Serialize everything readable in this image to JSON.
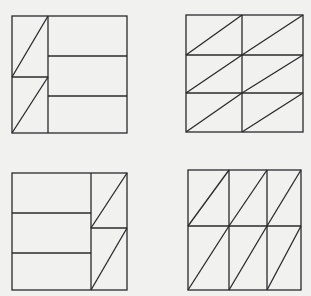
{
  "figures": [
    {
      "id": "figure-top-left",
      "frame": {
        "x": 12,
        "y": 16,
        "w": 115,
        "h": 117
      },
      "lines": [
        [
          48,
          16,
          48,
          133
        ],
        [
          12,
          77,
          48,
          77
        ],
        [
          48,
          56,
          127,
          56
        ],
        [
          48,
          96,
          127,
          96
        ],
        [
          12,
          77,
          48,
          16
        ],
        [
          12,
          133,
          48,
          77
        ]
      ]
    },
    {
      "id": "figure-top-right",
      "frame": {
        "x": 186,
        "y": 15,
        "w": 117,
        "h": 117
      },
      "lines": [
        [
          242,
          15,
          242,
          132
        ],
        [
          186,
          55,
          303,
          55
        ],
        [
          186,
          93,
          303,
          93
        ],
        [
          186,
          55,
          242,
          15
        ],
        [
          242,
          55,
          303,
          15
        ],
        [
          186,
          93,
          242,
          55
        ],
        [
          242,
          93,
          303,
          55
        ],
        [
          186,
          132,
          242,
          93
        ],
        [
          242,
          132,
          303,
          93
        ]
      ]
    },
    {
      "id": "figure-bottom-left",
      "frame": {
        "x": 12,
        "y": 173,
        "w": 115,
        "h": 117
      },
      "lines": [
        [
          91,
          173,
          91,
          290
        ],
        [
          12,
          213,
          91,
          213
        ],
        [
          12,
          253,
          91,
          253
        ],
        [
          91,
          228,
          127,
          228
        ],
        [
          91,
          228,
          127,
          173
        ],
        [
          91,
          290,
          127,
          228
        ]
      ]
    },
    {
      "id": "figure-bottom-right",
      "frame": {
        "x": 188,
        "y": 170,
        "w": 113,
        "h": 120
      },
      "lines": [
        [
          229,
          170,
          229,
          290
        ],
        [
          267,
          170,
          267,
          290
        ],
        [
          188,
          226,
          301,
          226
        ],
        [
          188,
          226,
          229,
          170
        ],
        [
          229,
          226,
          267,
          170
        ],
        [
          267,
          226,
          301,
          170
        ],
        [
          188,
          290,
          229,
          226
        ],
        [
          229,
          290,
          267,
          226
        ],
        [
          267,
          290,
          301,
          226
        ]
      ]
    }
  ],
  "style": {
    "stroke": "#2a2a2a",
    "background": "#f1f1f0"
  }
}
